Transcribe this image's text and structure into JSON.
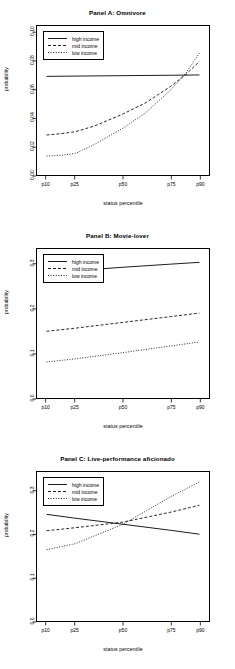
{
  "figure": {
    "xlabel": "status percentile",
    "ylabel": "probability",
    "legend": [
      {
        "label": "high income",
        "style": "solid"
      },
      {
        "label": "mid income",
        "style": "dashed"
      },
      {
        "label": "low income",
        "style": "dotted"
      }
    ]
  },
  "chart_data": [
    {
      "type": "line",
      "title": "Panel A: Omnivore",
      "xlabel": "status percentile",
      "ylabel": "probability",
      "categories": [
        "p10",
        "p25",
        "p50",
        "p75",
        "p90"
      ],
      "x": [
        10,
        25,
        50,
        75,
        90
      ],
      "xlim": [
        5,
        95
      ],
      "ylim": [
        0.0,
        0.105
      ],
      "yticks": [
        "0.00",
        "0.02",
        "0.04",
        "0.06",
        "0.08",
        "0.10"
      ],
      "ytickvalues": [
        0.0,
        0.02,
        0.04,
        0.06,
        0.08,
        0.1
      ],
      "grid": false,
      "legend_position": "top-left",
      "series": [
        {
          "name": "high income",
          "style": "solid",
          "x": [
            10,
            25,
            50,
            75,
            90
          ],
          "values": [
            0.0695,
            0.0697,
            0.07,
            0.0703,
            0.0705
          ]
        },
        {
          "name": "mid income",
          "style": "dashed",
          "x": [
            10,
            18,
            25,
            35,
            50,
            62,
            75,
            83,
            90
          ],
          "values": [
            0.0282,
            0.0292,
            0.0305,
            0.0345,
            0.043,
            0.051,
            0.0625,
            0.071,
            0.08
          ]
        },
        {
          "name": "low income",
          "style": "dotted",
          "x": [
            10,
            18,
            25,
            35,
            50,
            62,
            75,
            83,
            90
          ],
          "values": [
            0.0133,
            0.014,
            0.0152,
            0.0215,
            0.033,
            0.044,
            0.06,
            0.072,
            0.086
          ]
        }
      ]
    },
    {
      "type": "line",
      "title": "Panel B: Movie-lover",
      "xlabel": "status percentile",
      "ylabel": "probability",
      "categories": [
        "p10",
        "p25",
        "p50",
        "p75",
        "p90"
      ],
      "x": [
        10,
        25,
        50,
        75,
        90
      ],
      "xlim": [
        5,
        95
      ],
      "ylim": [
        0.0,
        0.335
      ],
      "yticks": [
        "0.0",
        "0.1",
        "0.2",
        "0.3"
      ],
      "ytickvalues": [
        0.0,
        0.1,
        0.2,
        0.3
      ],
      "grid": false,
      "legend_position": "top-left",
      "series": [
        {
          "name": "high income",
          "style": "solid",
          "x": [
            10,
            25,
            50,
            75,
            90
          ],
          "values": [
            0.281,
            0.286,
            0.294,
            0.301,
            0.305
          ]
        },
        {
          "name": "mid income",
          "style": "dashed",
          "x": [
            10,
            25,
            50,
            75,
            90
          ],
          "values": [
            0.15,
            0.157,
            0.17,
            0.183,
            0.191
          ]
        },
        {
          "name": "low income",
          "style": "dotted",
          "x": [
            10,
            25,
            50,
            75,
            90
          ],
          "values": [
            0.081,
            0.088,
            0.102,
            0.117,
            0.126
          ]
        }
      ]
    },
    {
      "type": "line",
      "title": "Panel C: Live-performance aficionado",
      "xlabel": "status percentile",
      "ylabel": "probability",
      "categories": [
        "p10",
        "p25",
        "p50",
        "p75",
        "p90"
      ],
      "x": [
        10,
        25,
        50,
        75,
        90
      ],
      "xlim": [
        5,
        95
      ],
      "ylim": [
        0.0,
        0.345
      ],
      "yticks": [
        "0.0",
        "0.1",
        "0.2",
        "0.3"
      ],
      "ytickvalues": [
        0.0,
        0.1,
        0.2,
        0.3
      ],
      "grid": false,
      "legend_position": "top-left",
      "series": [
        {
          "name": "high income",
          "style": "solid",
          "x": [
            10,
            25,
            50,
            75,
            90
          ],
          "values": [
            0.247,
            0.238,
            0.224,
            0.21,
            0.201
          ]
        },
        {
          "name": "mid income",
          "style": "dashed",
          "x": [
            10,
            25,
            50,
            75,
            90
          ],
          "values": [
            0.209,
            0.216,
            0.229,
            0.252,
            0.268
          ]
        },
        {
          "name": "low income",
          "style": "dotted",
          "x": [
            10,
            25,
            50,
            75,
            90
          ],
          "values": [
            0.165,
            0.179,
            0.224,
            0.288,
            0.322
          ]
        }
      ]
    }
  ]
}
